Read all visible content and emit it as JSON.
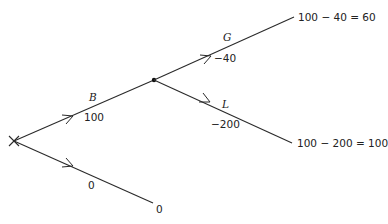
{
  "diagram": {
    "type": "decision-tree",
    "root": {
      "symbol": "×",
      "x": 14,
      "y": 141
    },
    "nodes": [
      {
        "id": "root",
        "x": 14,
        "y": 141,
        "kind": "cross"
      },
      {
        "id": "mid",
        "x": 154,
        "y": 80,
        "kind": "dot"
      },
      {
        "id": "end-g",
        "x": 294,
        "y": 17,
        "kind": "leaf"
      },
      {
        "id": "end-l",
        "x": 292,
        "y": 143,
        "kind": "leaf"
      },
      {
        "id": "end-0",
        "x": 153,
        "y": 203,
        "kind": "leaf"
      }
    ],
    "edges": [
      {
        "id": "edge-b",
        "from": "root",
        "to": "mid",
        "name": "B",
        "value": "100"
      },
      {
        "id": "edge-0",
        "from": "root",
        "to": "end-0",
        "name": "",
        "value": "0"
      },
      {
        "id": "edge-g",
        "from": "mid",
        "to": "end-g",
        "name": "G",
        "value": "−40"
      },
      {
        "id": "edge-l",
        "from": "mid",
        "to": "end-l",
        "name": "L",
        "value": "−200"
      }
    ],
    "labels": {
      "b_name": "B",
      "b_value": "100",
      "zero_value": "0",
      "g_name": "G",
      "g_value": "−40",
      "l_name": "L",
      "l_value": "−200"
    },
    "outcomes": {
      "g": "100 − 40 = 60",
      "l": "100 − 200 = 100",
      "zero": "0"
    }
  }
}
